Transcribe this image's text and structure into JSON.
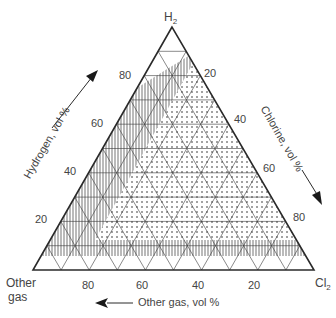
{
  "diagram": {
    "type": "ternary",
    "vertices": {
      "top": {
        "label": "H",
        "sub": "2"
      },
      "left": {
        "label_line1": "Other",
        "label_line2": "gas"
      },
      "right": {
        "label": "Cl",
        "sub": "2"
      }
    },
    "axes": {
      "hydrogen": {
        "title": "Hydrogen, vol %",
        "ticks": [
          "20",
          "40",
          "60",
          "80"
        ]
      },
      "chlorine": {
        "title": "Chlorine, vol %",
        "ticks": [
          "20",
          "40",
          "60",
          "80"
        ]
      },
      "other_gas": {
        "title": "Other gas, vol %",
        "ticks": [
          "80",
          "60",
          "40",
          "20"
        ]
      }
    },
    "regions": [
      {
        "name": "white-cap",
        "fill": "none"
      },
      {
        "name": "vertical-hatched",
        "fill": "vertical-lines"
      },
      {
        "name": "dotted",
        "fill": "dots"
      },
      {
        "name": "white-bottom-strip",
        "fill": "none"
      }
    ],
    "colors": {
      "line": "#2a2a2a",
      "grid": "#3a3a3a",
      "text": "#444444"
    }
  },
  "chart_data": {
    "type": "ternary",
    "title": "",
    "axes": [
      "Hydrogen, vol %",
      "Chlorine, vol %",
      "Other gas, vol %"
    ],
    "grid_step": 10,
    "tick_labels": [
      20,
      40,
      60,
      80
    ],
    "vertices": [
      "H2",
      "Other gas",
      "Cl2"
    ]
  }
}
